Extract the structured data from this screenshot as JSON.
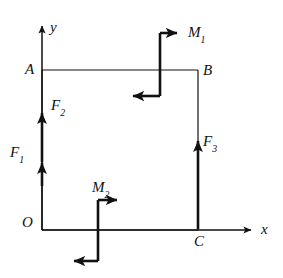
{
  "figure": {
    "stroke_color": "#111111",
    "background_color": "#ffffff"
  },
  "axes": {
    "x_label": "x",
    "y_label": "y",
    "origin_label": "O"
  },
  "points": [
    {
      "id": "A",
      "label": "A",
      "x": 42,
      "y": 70
    },
    {
      "id": "B",
      "label": "B",
      "x": 198,
      "y": 70
    },
    {
      "id": "C",
      "label": "C",
      "x": 198,
      "y": 230
    },
    {
      "id": "O",
      "label": "O",
      "x": 42,
      "y": 230
    }
  ],
  "forces": [
    {
      "id": "F1",
      "name": "F",
      "subscript": "1",
      "label": "F",
      "direction": "up",
      "location": "left-side-lower"
    },
    {
      "id": "F2",
      "name": "F",
      "subscript": "2",
      "label": "F",
      "direction": "up",
      "location": "left-side-upper"
    },
    {
      "id": "F3",
      "name": "F",
      "subscript": "3",
      "label": "F",
      "direction": "up",
      "location": "right-side"
    }
  ],
  "moments": [
    {
      "id": "M1",
      "name": "M",
      "subscript": "1",
      "label": "M",
      "sense": "clockwise",
      "location": "top-edge"
    },
    {
      "id": "M2",
      "name": "M",
      "subscript": "2",
      "label": "M",
      "sense": "clockwise",
      "location": "bottom-edge"
    }
  ],
  "labels": {
    "A": "A",
    "B": "B",
    "C": "C",
    "O": "O",
    "x": "x",
    "y": "y",
    "F1_base": "F",
    "F1_sub": "1",
    "F2_base": "F",
    "F2_sub": "2",
    "F3_base": "F",
    "F3_sub": "3",
    "M1_base": "M",
    "M1_sub": "1",
    "M2_base": "M",
    "M2_sub": "2"
  }
}
